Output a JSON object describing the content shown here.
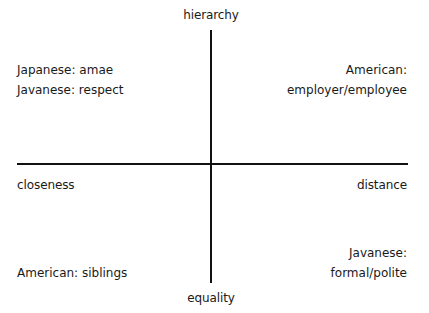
{
  "diagram": {
    "type": "two-axis quadrant diagram",
    "axes": {
      "vertical": {
        "top_label": "hierarchy",
        "bottom_label": "equality"
      },
      "horizontal": {
        "left_label": "closeness",
        "right_label": "distance"
      }
    },
    "quadrants": {
      "top_left": {
        "lines": [
          "Japanese: amae",
          "Javanese: respect"
        ]
      },
      "top_right": {
        "lines": [
          "American:",
          "employer/employee"
        ]
      },
      "bottom_left": {
        "lines": [
          "American: siblings"
        ]
      },
      "bottom_right": {
        "lines": [
          "Javanese:",
          "formal/polite"
        ]
      }
    },
    "colors": {
      "axis": "#111111",
      "text": "#1a1a1a",
      "background": "#ffffff"
    }
  }
}
